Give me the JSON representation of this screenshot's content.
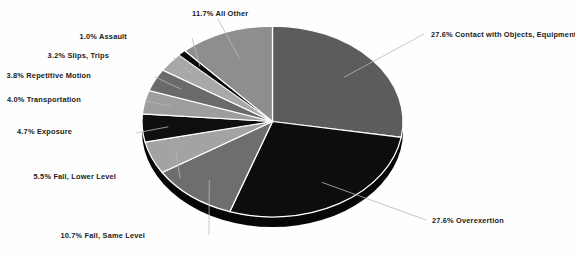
{
  "chart_data": {
    "type": "pie",
    "title": "",
    "subtitle": "",
    "xlabel": "",
    "ylabel": "",
    "grid": false,
    "legend_position": "none",
    "labels_outside": true,
    "three_d": true,
    "start_angle_deg": 0,
    "direction": "clockwise",
    "categories": [
      "Contact with Objects, Equipment",
      "Overexertion",
      "Fall, Same Level",
      "Fall, Lower Level",
      "Exposure",
      "Transportation",
      "Repetitive Motion",
      "Slips, Trips",
      "Assault",
      "All Other"
    ],
    "values": [
      27.6,
      27.6,
      10.7,
      5.5,
      4.7,
      4.0,
      3.8,
      3.2,
      1.0,
      11.7
    ],
    "value_unit": "%",
    "colors": [
      "#5c5c5c",
      "#0d0d0d",
      "#6e6e6e",
      "#a3a3a3",
      "#0f0f0f",
      "#9e9e9e",
      "#6a6a6a",
      "#a8a8a8",
      "#070707",
      "#8e8e8e"
    ],
    "slice_separator_color": "#ffffff",
    "depth_color": "#060606",
    "data_labels": [
      {
        "text": "27.6% Contact with Objects, Equipment",
        "percent": 27.6,
        "category": "Contact with Objects, Equipment"
      },
      {
        "text": "27.6% Overexertion",
        "percent": 27.6,
        "category": "Overexertion"
      },
      {
        "text": "10.7% Fall, Same Level",
        "percent": 10.7,
        "category": "Fall, Same Level"
      },
      {
        "text": "5.5% Fall, Lower Level",
        "percent": 5.5,
        "category": "Fall, Lower Level"
      },
      {
        "text": "4.7% Exposure",
        "percent": 4.7,
        "category": "Exposure"
      },
      {
        "text": "4.0% Transportation",
        "percent": 4.0,
        "category": "Transportation"
      },
      {
        "text": "3.8% Repetitive Motion",
        "percent": 3.8,
        "category": "Repetitive Motion"
      },
      {
        "text": "3.2% Slips, Trips",
        "percent": 3.2,
        "category": "Slips, Trips"
      },
      {
        "text": "1.0% Assault",
        "percent": 1.0,
        "category": "Assault"
      },
      {
        "text": "11.7% All Other",
        "percent": 11.7,
        "category": "All Other"
      }
    ]
  },
  "labels": {
    "contact": "27.6% Contact with Objects, Equipment",
    "overexertion": "27.6% Overexertion",
    "fall_same": "10.7% Fall, Same Level",
    "fall_lower": "5.5% Fall, Lower Level",
    "exposure": "4.7% Exposure",
    "transportation": "4.0% Transportation",
    "repetitive": "3.8% Repetitive Motion",
    "slips": "3.2% Slips, Trips",
    "assault": "1.0% Assault",
    "all_other": "11.7% All Other"
  },
  "colors": {
    "background": "#fefefe",
    "label_text": "#1b1b1b",
    "leader_line": "#b9b9b9"
  }
}
